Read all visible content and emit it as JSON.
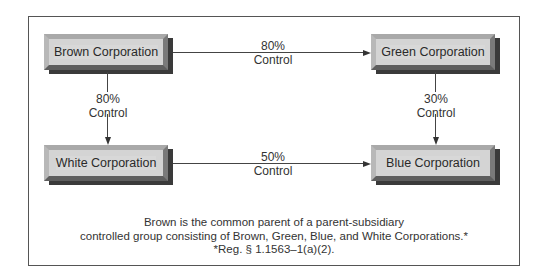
{
  "nodes": {
    "brown": "Brown Corporation",
    "green": "Green Corporation",
    "white": "White Corporation",
    "blue": "Blue Corporation"
  },
  "edges": {
    "brown_green": {
      "pct": "80%",
      "word": "Control"
    },
    "brown_white": {
      "pct": "80%",
      "word": "Control"
    },
    "green_blue": {
      "pct": "30%",
      "word": "Control"
    },
    "white_blue": {
      "pct": "50%",
      "word": "Control"
    }
  },
  "caption": {
    "line1": "Brown is the common parent of a parent-subsidiary",
    "line2": "controlled group consisting of Brown, Green, Blue, and White Corporations.*",
    "line3": "*Reg. § 1.1563–1(a)(2)."
  }
}
